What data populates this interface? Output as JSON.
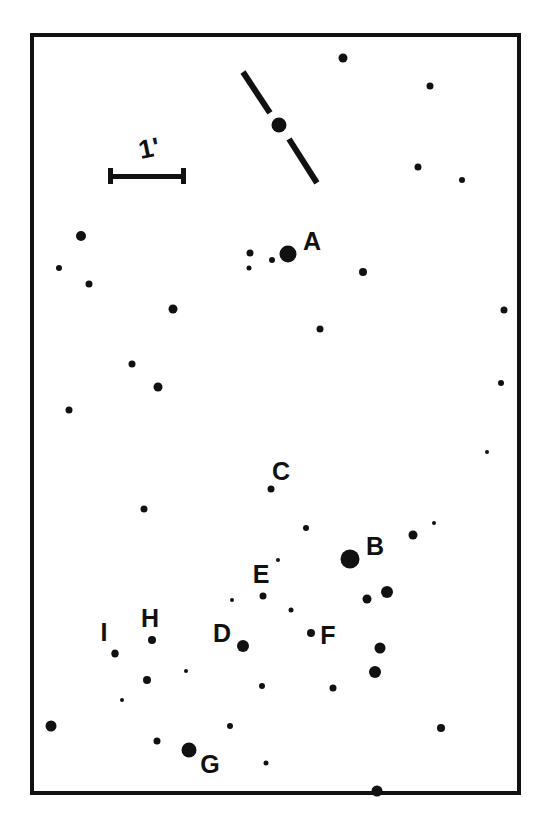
{
  "image": {
    "kind": "astronomical-finder-chart",
    "width": 551,
    "height": 823,
    "background_color": "#ffffff",
    "ink_color": "#111111"
  },
  "frame": {
    "name": "field-border",
    "left": 30,
    "top": 33,
    "width": 491,
    "height": 762,
    "border_width": 4,
    "border_color": "#111111"
  },
  "scale_bar": {
    "label": "1'",
    "label_x": 149,
    "label_y": 148,
    "label_font_size": 26,
    "bar_left": 108,
    "bar_right": 186,
    "bar_y": 176,
    "bar_thickness": 5,
    "cap_height": 16,
    "cap_width": 5
  },
  "target": {
    "name": "target-star",
    "x": 279,
    "y": 125,
    "r": 7.5,
    "tick_marks": [
      {
        "x1": 243,
        "y1": 72,
        "x2": 270,
        "y2": 113,
        "thickness": 6
      },
      {
        "x1": 289,
        "y1": 139,
        "x2": 317,
        "y2": 183,
        "thickness": 6
      }
    ]
  },
  "labels": [
    {
      "id": "A",
      "text": "A",
      "x": 312,
      "y": 241,
      "font_size": 25
    },
    {
      "id": "B",
      "text": "B",
      "x": 375,
      "y": 546,
      "font_size": 25
    },
    {
      "id": "C",
      "text": "C",
      "x": 281,
      "y": 471,
      "font_size": 25
    },
    {
      "id": "D",
      "text": "D",
      "x": 222,
      "y": 633,
      "font_size": 25
    },
    {
      "id": "E",
      "text": "E",
      "x": 261,
      "y": 574,
      "font_size": 25
    },
    {
      "id": "F",
      "text": "F",
      "x": 328,
      "y": 635,
      "font_size": 25
    },
    {
      "id": "G",
      "text": "G",
      "x": 210,
      "y": 764,
      "font_size": 25
    },
    {
      "id": "H",
      "text": "H",
      "x": 150,
      "y": 618,
      "font_size": 25
    },
    {
      "id": "I",
      "text": "I",
      "x": 104,
      "y": 632,
      "font_size": 25
    }
  ],
  "comparison_stars": [
    {
      "id": "A",
      "x": 288,
      "y": 254,
      "r": 8.5
    },
    {
      "id": "B",
      "x": 350,
      "y": 559,
      "r": 9.5
    },
    {
      "id": "C",
      "x": 271,
      "y": 489,
      "r": 3.5
    },
    {
      "id": "D",
      "x": 243,
      "y": 646,
      "r": 6.0
    },
    {
      "id": "E",
      "x": 263,
      "y": 596,
      "r": 3.5
    },
    {
      "id": "F",
      "x": 311,
      "y": 633,
      "r": 4.0
    },
    {
      "id": "G",
      "x": 189,
      "y": 750,
      "r": 7.5
    },
    {
      "id": "H",
      "x": 152,
      "y": 640,
      "r": 4.0
    },
    {
      "id": "I",
      "x": 115,
      "y": 654,
      "r": 3.5
    }
  ],
  "field_stars": [
    {
      "x": 343,
      "y": 58,
      "r": 4.5
    },
    {
      "x": 430,
      "y": 86,
      "r": 3.5
    },
    {
      "x": 418,
      "y": 167,
      "r": 3.5
    },
    {
      "x": 462,
      "y": 180,
      "r": 3.0
    },
    {
      "x": 81,
      "y": 236,
      "r": 5.0
    },
    {
      "x": 250,
      "y": 253,
      "r": 3.5
    },
    {
      "x": 272,
      "y": 260,
      "r": 3.0
    },
    {
      "x": 59,
      "y": 268,
      "r": 3.0
    },
    {
      "x": 89,
      "y": 284,
      "r": 3.5
    },
    {
      "x": 249,
      "y": 268,
      "r": 2.5
    },
    {
      "x": 363,
      "y": 272,
      "r": 4.0
    },
    {
      "x": 504,
      "y": 310,
      "r": 3.5
    },
    {
      "x": 173,
      "y": 309,
      "r": 4.5
    },
    {
      "x": 320,
      "y": 329,
      "r": 3.5
    },
    {
      "x": 132,
      "y": 364,
      "r": 3.5
    },
    {
      "x": 158,
      "y": 387,
      "r": 4.5
    },
    {
      "x": 501,
      "y": 383,
      "r": 3.0
    },
    {
      "x": 69,
      "y": 410,
      "r": 3.5
    },
    {
      "x": 144,
      "y": 509,
      "r": 3.5
    },
    {
      "x": 306,
      "y": 528,
      "r": 3.0
    },
    {
      "x": 413,
      "y": 535,
      "r": 4.5
    },
    {
      "x": 434,
      "y": 523,
      "r": 2.0
    },
    {
      "x": 387,
      "y": 592,
      "r": 6.0
    },
    {
      "x": 367,
      "y": 599,
      "r": 4.5
    },
    {
      "x": 278,
      "y": 560,
      "r": 2.0
    },
    {
      "x": 232,
      "y": 600,
      "r": 2.0
    },
    {
      "x": 291,
      "y": 610,
      "r": 2.5
    },
    {
      "x": 380,
      "y": 648,
      "r": 5.5
    },
    {
      "x": 115,
      "y": 653,
      "r": 3.5
    },
    {
      "x": 147,
      "y": 680,
      "r": 4.0
    },
    {
      "x": 262,
      "y": 686,
      "r": 3.0
    },
    {
      "x": 333,
      "y": 688,
      "r": 3.5
    },
    {
      "x": 375,
      "y": 672,
      "r": 6.0
    },
    {
      "x": 51,
      "y": 726,
      "r": 5.5
    },
    {
      "x": 157,
      "y": 741,
      "r": 3.5
    },
    {
      "x": 230,
      "y": 726,
      "r": 3.0
    },
    {
      "x": 441,
      "y": 728,
      "r": 4.0
    },
    {
      "x": 266,
      "y": 763,
      "r": 2.5
    },
    {
      "x": 377,
      "y": 791,
      "r": 5.5
    },
    {
      "x": 122,
      "y": 700,
      "r": 2.0
    },
    {
      "x": 186,
      "y": 671,
      "r": 2.0
    },
    {
      "x": 487,
      "y": 452,
      "r": 2.0
    }
  ]
}
